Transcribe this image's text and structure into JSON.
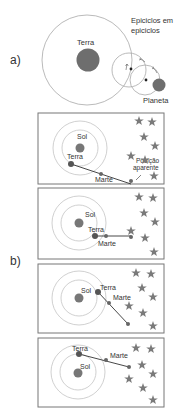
{
  "colors": {
    "line": "#999999",
    "orbit": "#bdbdbd",
    "body": "#6e6e6e",
    "dark_body": "#555555",
    "star": "#7a7a7a",
    "text": "#333333",
    "frame": "#777777"
  },
  "part_a": {
    "label": "a)",
    "earth_label": "Terra",
    "epicycles_label_line1": "Epiciclos em",
    "epicycles_label_line2": "epiciclos",
    "planet_label": "Planeta"
  },
  "part_b": {
    "label": "b)",
    "panels": [
      {
        "sun_label": "Sol",
        "earth_label": "Terra",
        "mars_label": "Marte",
        "apparent_label_line1": "Posição",
        "apparent_label_line2": "aparente"
      },
      {
        "sun_label": "Sol",
        "earth_label": "Terra",
        "mars_label": "Marte"
      },
      {
        "sun_label": "Sol",
        "earth_label": "Terra",
        "mars_label": "Marte"
      },
      {
        "sun_label": "Sol",
        "earth_label": "Terra",
        "mars_label": "Marte"
      }
    ]
  }
}
